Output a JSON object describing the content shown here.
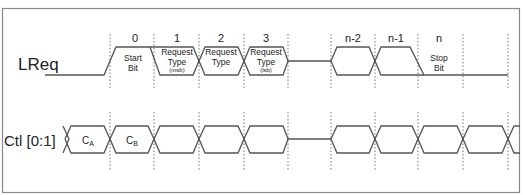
{
  "signals": {
    "lreq": {
      "label": "LReq"
    },
    "ctl": {
      "label": "Ctl [0:1]"
    }
  },
  "bit_numbers": [
    "0",
    "1",
    "2",
    "3",
    "n-2",
    "n-1",
    "n"
  ],
  "lreq_fields": [
    {
      "line1": "Start",
      "line2": "Bit",
      "line3": ""
    },
    {
      "line1": "Request",
      "line2": "Type",
      "line3": "(msb)"
    },
    {
      "line1": "Request",
      "line2": "Type",
      "line3": ""
    },
    {
      "line1": "Request",
      "line2": "Type",
      "line3": "(lsb)"
    },
    {
      "line1": "Stop",
      "line2": "Bit",
      "line3": ""
    }
  ],
  "ctl_fields": [
    {
      "main": "C",
      "sub": "A"
    },
    {
      "main": "C",
      "sub": "B"
    }
  ],
  "colors": {
    "line": "#555555",
    "frame": "#888888"
  }
}
